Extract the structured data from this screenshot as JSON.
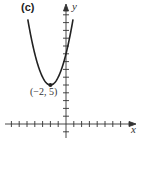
{
  "panel": {
    "label": "(c)"
  },
  "chart_data": {
    "type": "line",
    "title": "(c)",
    "xlabel": "x",
    "ylabel": "y",
    "function": "y = (x + 2)^2 + 5",
    "series": [
      {
        "name": "parabola",
        "x": [
          -4.9,
          -4,
          -3,
          -2,
          -1,
          0,
          0.9
        ],
        "y": [
          13.4,
          9,
          6,
          5,
          6,
          9,
          13.4
        ]
      }
    ],
    "annotations": [
      {
        "text": "(−2, 5)",
        "x": -2,
        "y": 5,
        "marker": "point"
      }
    ],
    "xlim": [
      -8,
      9
    ],
    "ylim": [
      -2,
      15
    ],
    "x_ticks": [
      -7,
      -6,
      -5,
      -4,
      -3,
      -2,
      -1,
      1,
      2,
      3,
      4,
      5,
      6,
      7
    ],
    "y_ticks": [
      -1,
      1,
      2,
      3,
      4,
      5,
      6,
      7,
      8,
      9,
      10,
      11,
      12,
      13,
      14
    ],
    "grid": false
  },
  "style": {
    "ink": "#222222",
    "axis": "#333333"
  }
}
